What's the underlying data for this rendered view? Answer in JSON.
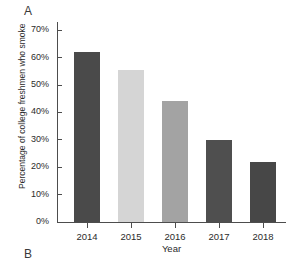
{
  "panels": {
    "top_label": "A",
    "bottom_label": "B"
  },
  "chart_data": {
    "type": "bar",
    "title": "",
    "xlabel": "Year",
    "ylabel": "Percentage of college freshmen who smoke",
    "categories": [
      "2014",
      "2015",
      "2016",
      "2017",
      "2018"
    ],
    "values": [
      62,
      55.5,
      44,
      30,
      22
    ],
    "value_labels": [
      "62%",
      "55.5%",
      "44%",
      "30%",
      "22%"
    ],
    "bar_colors": [
      "#4a4a4a",
      "#d5d5d5",
      "#a3a3a3",
      "#4f4f4f",
      "#474747"
    ],
    "ylim": [
      0,
      73
    ],
    "ytick_values": [
      0,
      10,
      20,
      30,
      40,
      50,
      60,
      70
    ],
    "ytick_labels": [
      "0%",
      "10%",
      "20%",
      "30%",
      "40%",
      "50%",
      "60%",
      "70%"
    ],
    "grid": false,
    "legend": "none",
    "axis_color": "#4d4d4d"
  }
}
